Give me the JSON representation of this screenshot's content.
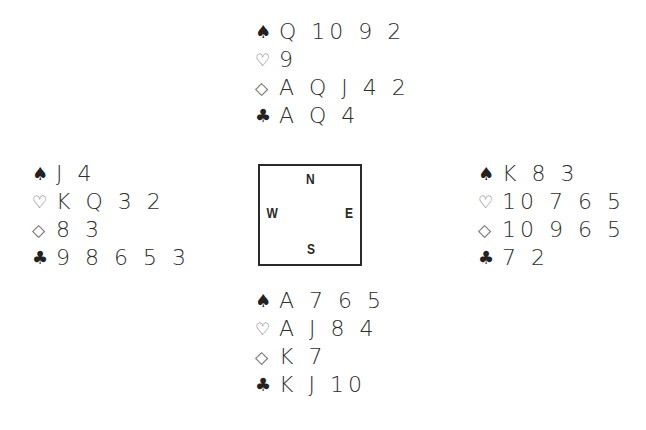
{
  "suit_symbols": {
    "spades": "♠",
    "hearts": "♡",
    "diamonds": "◇",
    "clubs": "♣"
  },
  "compass": {
    "north": "N",
    "south": "S",
    "east": "E",
    "west": "W"
  },
  "hands": {
    "north": {
      "spades": "Q 10 9 2",
      "hearts": "9",
      "diamonds": "A Q J 4 2",
      "clubs": "A Q 4"
    },
    "west": {
      "spades": "J 4",
      "hearts": "K Q 3 2",
      "diamonds": "8 3",
      "clubs": "9 8 6 5 3"
    },
    "east": {
      "spades": "K 8 3",
      "hearts": "10 7 6 5",
      "diamonds": "10 9 6 5",
      "clubs": "7 2"
    },
    "south": {
      "spades": "A 7 6 5",
      "hearts": "A J 8 4",
      "diamonds": "K 7",
      "clubs": "K J 10"
    }
  }
}
